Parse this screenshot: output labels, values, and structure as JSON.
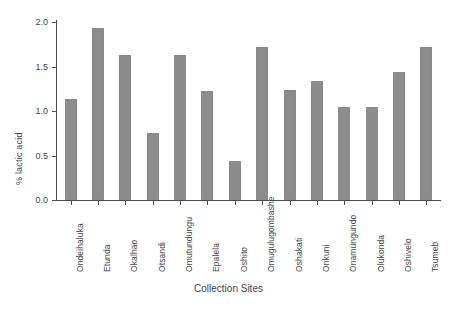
{
  "chart_data": {
    "type": "bar",
    "title": "",
    "xlabel": "Collection Sites",
    "ylabel": "% lactic acid",
    "categories": [
      "Ondeihaluka",
      "Etunda",
      "Okalhao",
      "Otsandi",
      "Omutundungu",
      "Epalela",
      "Oshito",
      "Omugulugombashe",
      "Oshakati",
      "Onkuni",
      "Onamungundo",
      "Olukonda",
      "Oshivelo",
      "Tsumeb"
    ],
    "values": [
      1.13,
      1.93,
      1.63,
      0.75,
      1.63,
      1.23,
      0.44,
      1.72,
      1.24,
      1.34,
      1.04,
      1.04,
      1.44,
      1.72
    ],
    "ylim": [
      0.0,
      2.0
    ],
    "yticks": [
      "0.0",
      "0.5",
      "1.0",
      "1.5",
      "2.0"
    ],
    "ytick_values": [
      0.0,
      0.5,
      1.0,
      1.5,
      2.0
    ],
    "grid": false,
    "legend": null,
    "bar_color": "#8c8c8c",
    "axis_color": "#4d4d4d",
    "background": "#ffffff"
  }
}
